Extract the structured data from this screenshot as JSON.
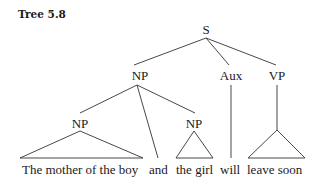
{
  "figure": {
    "title": "Tree 5.8"
  },
  "tree": {
    "root": "S",
    "nodes": {
      "s": "S",
      "np_top": "NP",
      "aux": "Aux",
      "vp": "VP",
      "np_left": "NP",
      "np_right": "NP"
    },
    "words": {
      "w1": "The mother of the boy",
      "w2": "and",
      "w3": "the girl",
      "w4": "will",
      "w5": "leave soon"
    },
    "structure": [
      {
        "parent": "S",
        "children": [
          "NP",
          "Aux",
          "VP"
        ]
      },
      {
        "parent": "NP",
        "children": [
          "NP",
          "and",
          "NP"
        ]
      },
      {
        "parent": "NP (left)",
        "children": [
          "The mother of the boy"
        ],
        "triangle": true
      },
      {
        "parent": "NP (right)",
        "children": [
          "the girl"
        ],
        "triangle": true
      },
      {
        "parent": "Aux",
        "children": [
          "will"
        ]
      },
      {
        "parent": "VP",
        "children": [
          "leave soon"
        ],
        "triangle": true
      }
    ]
  }
}
